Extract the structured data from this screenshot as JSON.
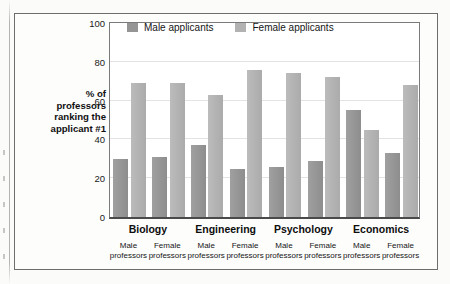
{
  "figure": {
    "background_color": "#fdfdfc",
    "frame_color": "#6e6e6e"
  },
  "y_axis_title_lines": [
    "% of",
    "professors",
    "ranking the",
    "applicant #1"
  ],
  "legend": {
    "items": [
      {
        "label": "Male applicants",
        "color": "#959595",
        "icon": "legend-swatch-icon"
      },
      {
        "label": "Female applicants",
        "color": "#b2b2b2",
        "icon": "legend-swatch-icon"
      }
    ]
  },
  "x_axis": {
    "groups": [
      "Biology",
      "Engineering",
      "Psychology",
      "Economics"
    ],
    "sub_labels": [
      {
        "line1": "Male",
        "line2": "professors"
      },
      {
        "line1": "Female",
        "line2": "professors"
      },
      {
        "line1": "Male",
        "line2": "professors"
      },
      {
        "line1": "Female",
        "line2": "professors"
      },
      {
        "line1": "Male",
        "line2": "professors"
      },
      {
        "line1": "Female",
        "line2": "professors"
      },
      {
        "line1": "Male",
        "line2": "professors"
      },
      {
        "line1": "Female",
        "line2": "professors"
      }
    ]
  },
  "chart_data": {
    "type": "bar",
    "title": "",
    "xlabel": "",
    "ylabel": "% of professors ranking the applicant #1",
    "ylim": [
      0,
      100
    ],
    "yticks": [
      0,
      20,
      40,
      60,
      80,
      100
    ],
    "ytick_labels": [
      "0",
      "20",
      "40",
      "60",
      "80",
      "100"
    ],
    "grid": true,
    "grid_axis": "y",
    "legend_position": "top-right-inside",
    "categories": [
      "Biology / Male professors",
      "Biology / Female professors",
      "Engineering / Male professors",
      "Engineering / Female professors",
      "Psychology / Male professors",
      "Psychology / Female professors",
      "Economics / Male professors",
      "Economics / Female professors"
    ],
    "groups": [
      "Biology",
      "Engineering",
      "Psychology",
      "Economics"
    ],
    "subgroups": [
      "Male professors",
      "Female professors"
    ],
    "series": [
      {
        "name": "Male applicants",
        "color": "#959595",
        "values": [
          30,
          31,
          37,
          25,
          26,
          29,
          55,
          33
        ]
      },
      {
        "name": "Female applicants",
        "color": "#b2b2b2",
        "values": [
          69,
          69,
          63,
          76,
          74,
          72,
          45,
          68
        ]
      }
    ]
  }
}
